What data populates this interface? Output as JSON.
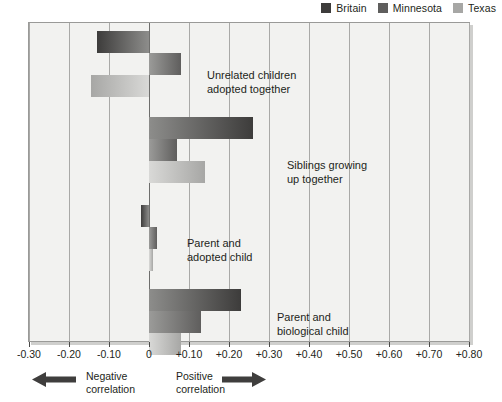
{
  "legend": {
    "items": [
      {
        "label": "Britain",
        "color": "#3d3c3b"
      },
      {
        "label": "Minnesota",
        "color": "#5f5e5d"
      },
      {
        "label": "Texas",
        "color": "#a7a7a5"
      }
    ]
  },
  "axis": {
    "ticks": [
      "-0.30",
      "-0.20",
      "-0.10",
      "0",
      "+0.10",
      "+0.20",
      "+0.30",
      "+0.40",
      "+0.50",
      "+0.60",
      "+0.70",
      "+0.80"
    ],
    "negative_note": "Negative\ncorrelation",
    "positive_note": "Positive\ncorrelation",
    "left-arrow-icon": "◀",
    "right-arrow-icon": "▶"
  },
  "groups": [
    {
      "label": "Unrelated children\nadopted together"
    },
    {
      "label": "Siblings growing\nup together"
    },
    {
      "label": "Parent and\nadopted child"
    },
    {
      "label": "Parent and\nbiological child"
    }
  ],
  "chart_data": {
    "type": "bar",
    "orientation": "horizontal",
    "title": "",
    "xlabel": "Correlation",
    "ylabel": "",
    "xlim": [
      -0.3,
      0.8
    ],
    "xticks": [
      -0.3,
      -0.2,
      -0.1,
      0,
      0.1,
      0.2,
      0.3,
      0.4,
      0.5,
      0.6,
      0.7,
      0.8
    ],
    "grid": true,
    "legend_position": "top-right",
    "categories": [
      "Unrelated children adopted together",
      "Siblings growing up together",
      "Parent and adopted child",
      "Parent and biological child"
    ],
    "series": [
      {
        "name": "Britain",
        "color": "#3d3c3b",
        "values": [
          -0.13,
          0.26,
          -0.02,
          0.23
        ]
      },
      {
        "name": "Minnesota",
        "color": "#5f5e5d",
        "values": [
          0.08,
          0.07,
          0.02,
          0.13
        ]
      },
      {
        "name": "Texas",
        "color": "#a7a7a5",
        "values": [
          -0.145,
          0.14,
          0.01,
          0.08
        ]
      }
    ],
    "annotations": [
      "Negative correlation",
      "Positive correlation"
    ]
  }
}
